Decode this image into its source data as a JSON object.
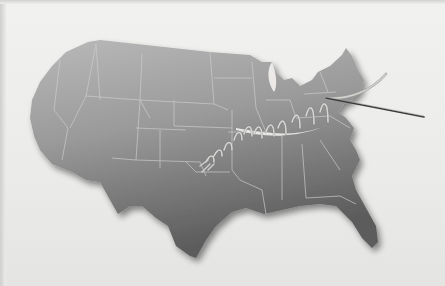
{
  "image": {
    "description": "Printed page photo showing a gray 3D map of the contiguous United States with a surgical suture thread stitching across the middle of the country and a needle exiting toward the northeast",
    "colors": {
      "background": "#ececea",
      "map_light": "#b8b8b8",
      "map_dark": "#5e5e5e",
      "state_lines": "#c9c9c9",
      "thread": "#bdbdbd",
      "needle": "#3a3a3a"
    }
  }
}
